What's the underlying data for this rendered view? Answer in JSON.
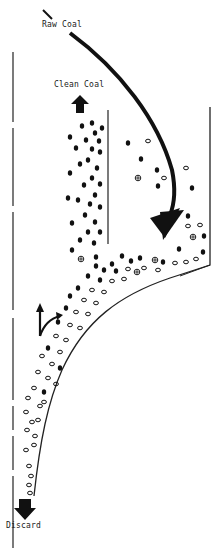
{
  "diagram": {
    "type": "coal separation flow diagram",
    "labels": {
      "raw_coal": "Raw Coal",
      "clean_coal": "Clean Coal",
      "discard": "Discard"
    },
    "icons": {
      "feed_arrow": "curved-arrow-down-right",
      "clean_arrow": "arrow-up",
      "discard_arrow": "arrow-down",
      "flow_split": "split-arrow-up-right"
    },
    "colors": {
      "ink": "#111111",
      "background": "#ffffff"
    },
    "legend": {
      "solid_particles": "clean coal (light)",
      "hollow_particles": "refuse (heavy)"
    }
  }
}
